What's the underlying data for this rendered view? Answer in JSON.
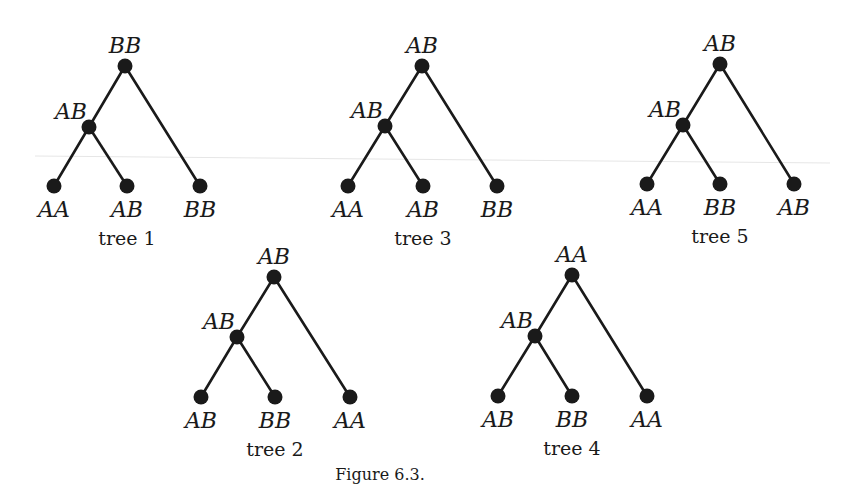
{
  "figure": {
    "caption": "Figure 6.3."
  },
  "trees": [
    {
      "caption": "tree 1",
      "root": {
        "label": "BB",
        "x": 125,
        "y": 66
      },
      "internal": {
        "label": "AB",
        "x": 89,
        "y": 127
      },
      "leaves": [
        {
          "label": "AA",
          "x": 54,
          "y": 186
        },
        {
          "label": "AB",
          "x": 127,
          "y": 186
        },
        {
          "label": "BB",
          "x": 200,
          "y": 186
        }
      ],
      "caption_pos": {
        "x": 127,
        "y": 245
      }
    },
    {
      "caption": "tree 3",
      "root": {
        "label": "AB",
        "x": 422,
        "y": 66
      },
      "internal": {
        "label": "AB",
        "x": 385,
        "y": 126
      },
      "leaves": [
        {
          "label": "AA",
          "x": 348,
          "y": 186
        },
        {
          "label": "AB",
          "x": 423,
          "y": 186
        },
        {
          "label": "BB",
          "x": 497,
          "y": 186
        }
      ],
      "caption_pos": {
        "x": 423,
        "y": 245
      }
    },
    {
      "caption": "tree 5",
      "root": {
        "label": "AB",
        "x": 720,
        "y": 64
      },
      "internal": {
        "label": "AB",
        "x": 683,
        "y": 125
      },
      "leaves": [
        {
          "label": "AA",
          "x": 647,
          "y": 184
        },
        {
          "label": "BB",
          "x": 720,
          "y": 184
        },
        {
          "label": "AB",
          "x": 794,
          "y": 184
        }
      ],
      "caption_pos": {
        "x": 720,
        "y": 243
      }
    },
    {
      "caption": "tree 2",
      "root": {
        "label": "AB",
        "x": 274,
        "y": 277
      },
      "internal": {
        "label": "AB",
        "x": 237,
        "y": 337
      },
      "leaves": [
        {
          "label": "AB",
          "x": 201,
          "y": 397
        },
        {
          "label": "BB",
          "x": 275,
          "y": 397
        },
        {
          "label": "AA",
          "x": 350,
          "y": 397
        }
      ],
      "caption_pos": {
        "x": 275,
        "y": 456
      }
    },
    {
      "caption": "tree 4",
      "root": {
        "label": "AA",
        "x": 572,
        "y": 275
      },
      "internal": {
        "label": "AB",
        "x": 535,
        "y": 336
      },
      "leaves": [
        {
          "label": "AB",
          "x": 498,
          "y": 396
        },
        {
          "label": "BB",
          "x": 572,
          "y": 396
        },
        {
          "label": "AA",
          "x": 647,
          "y": 396
        }
      ],
      "caption_pos": {
        "x": 572,
        "y": 455
      }
    }
  ]
}
